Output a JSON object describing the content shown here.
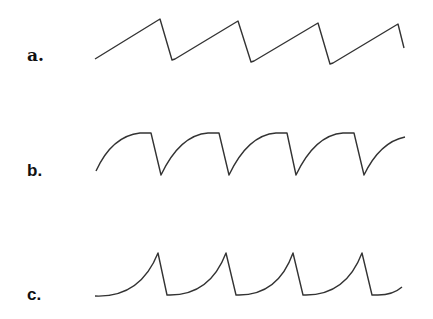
{
  "figure": {
    "panels": [
      {
        "id": "a",
        "label": "a.",
        "shape": "linear sawtooth (ramp up, sharp drop)"
      },
      {
        "id": "b",
        "label": "b.",
        "shape": "concave-down rise to plateau, sharp drop"
      },
      {
        "id": "c",
        "label": "c.",
        "shape": "concave-up rise to sharp peak, sharp drop"
      }
    ]
  },
  "colors": {
    "stroke": "#333333",
    "background": "#ffffff"
  }
}
